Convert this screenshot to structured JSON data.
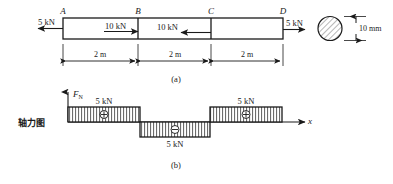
{
  "figure": {
    "title_cn": "轴力图",
    "panels": [
      {
        "id": "a",
        "caption": "(a)"
      },
      {
        "id": "b",
        "caption": "(b)"
      }
    ]
  },
  "beam": {
    "nodes": [
      "A",
      "B",
      "C",
      "D"
    ],
    "segments": [
      {
        "from": "A",
        "to": "B",
        "length_label": "2 m"
      },
      {
        "from": "B",
        "to": "C",
        "length_label": "2 m"
      },
      {
        "from": "C",
        "to": "D",
        "length_label": "2 m"
      }
    ],
    "loads": [
      {
        "at": "A",
        "label": "5 kN",
        "direction": "left"
      },
      {
        "at": "B",
        "label": "10 kN",
        "direction": "right"
      },
      {
        "at": "C",
        "label": "10 kN",
        "direction": "left"
      },
      {
        "at": "D",
        "label": "5 kN",
        "direction": "right"
      }
    ],
    "cross_section": {
      "shape": "circle",
      "diameter_label": "10 mm"
    }
  },
  "axial_diagram": {
    "y_axis_label": "F",
    "y_axis_subscript": "N",
    "x_axis_label": "x",
    "blocks": [
      {
        "segment": "A-B",
        "value_label": "5 kN",
        "sign": "+",
        "sign_glyph": "⊕",
        "label_position": "above"
      },
      {
        "segment": "B-C",
        "value_label": "5 kN",
        "sign": "-",
        "sign_glyph": "⊖",
        "label_position": "below"
      },
      {
        "segment": "C-D",
        "value_label": "5 kN",
        "sign": "+",
        "sign_glyph": "⊕",
        "label_position": "above"
      }
    ]
  },
  "colors": {
    "line": "#1a1a1a",
    "hatch": "#555555",
    "fill": "#ffffff"
  }
}
